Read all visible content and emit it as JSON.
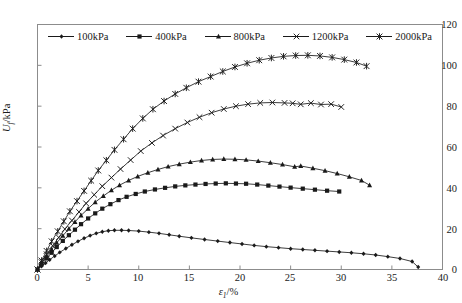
{
  "figure": {
    "background": "#ffffff",
    "frame_color": "#8c8c8c",
    "line_color": "#1a1a1a"
  },
  "axes": {
    "y": {
      "title": "U",
      "title_sub": "f",
      "title_unit": "/kPa",
      "min": 0,
      "max": 120,
      "ticks": [
        0,
        20,
        40,
        60,
        80,
        100,
        120
      ]
    },
    "x": {
      "title": "ε",
      "title_sub": "1",
      "title_unit": "/%",
      "min": 0,
      "max": 40,
      "ticks": [
        0,
        5,
        10,
        15,
        20,
        25,
        30,
        35,
        40
      ]
    }
  },
  "legend": {
    "position": "top-inside",
    "items": [
      {
        "label": "100kPa",
        "marker": "diamond-small"
      },
      {
        "label": "400kPa",
        "marker": "square"
      },
      {
        "label": "800kPa",
        "marker": "triangle"
      },
      {
        "label": "1200kPa",
        "marker": "x-cross"
      },
      {
        "label": "2000kPa",
        "marker": "asterisk"
      }
    ]
  },
  "chart_data": {
    "type": "line",
    "title": "",
    "xlabel": "ε₁/%",
    "ylabel": "U_f /kPa",
    "xlim": [
      0,
      40
    ],
    "ylim": [
      0,
      120
    ],
    "grid": false,
    "legend_position": "top-inside",
    "series": [
      {
        "name": "100kPa",
        "marker": "diamond-small",
        "x": [
          0,
          0.4,
          0.8,
          1.2,
          1.7,
          2.2,
          2.8,
          3.4,
          4.0,
          4.6,
          5.2,
          5.8,
          6.4,
          7.0,
          7.6,
          8.3,
          9.0,
          10.0,
          11.0,
          12.0,
          13.0,
          14.0,
          15.2,
          16.5,
          17.8,
          19.0,
          20.2,
          21.4,
          22.6,
          23.8,
          25.0,
          26.2,
          27.4,
          28.6,
          29.8,
          31.0,
          32.2,
          33.4,
          34.6,
          35.8,
          37.0,
          37.6
        ],
        "y": [
          0,
          1.6,
          3.2,
          4.8,
          6.6,
          8.4,
          10.3,
          12.1,
          13.8,
          15.3,
          16.6,
          17.7,
          18.5,
          19.0,
          19.2,
          19.2,
          19.1,
          18.8,
          18.3,
          17.7,
          17.0,
          16.3,
          15.5,
          14.7,
          13.9,
          13.2,
          12.5,
          11.8,
          11.2,
          10.7,
          10.2,
          9.8,
          9.4,
          9.0,
          8.6,
          8.2,
          7.7,
          7.1,
          6.3,
          5.4,
          3.9,
          1.2
        ]
      },
      {
        "name": "400kPa",
        "marker": "square",
        "x": [
          0,
          0.4,
          0.9,
          1.4,
          1.9,
          2.5,
          3.1,
          3.7,
          4.3,
          5.0,
          5.7,
          6.4,
          7.2,
          8.0,
          8.8,
          9.7,
          10.6,
          11.6,
          12.6,
          13.6,
          14.6,
          15.6,
          16.6,
          17.6,
          18.6,
          19.6,
          20.6,
          21.7,
          22.8,
          23.9,
          25.0,
          26.2,
          27.4,
          28.6,
          29.8
        ],
        "y": [
          0,
          2.6,
          5.4,
          8.2,
          11.0,
          14.0,
          16.8,
          19.5,
          22.2,
          25.0,
          27.5,
          29.8,
          32.0,
          34.0,
          35.6,
          37.0,
          38.2,
          39.2,
          40.0,
          40.7,
          41.2,
          41.6,
          41.9,
          42.1,
          42.2,
          42.1,
          42.0,
          41.6,
          41.1,
          40.6,
          40.1,
          39.6,
          39.1,
          38.6,
          38.2
        ]
      },
      {
        "name": "800kPa",
        "marker": "triangle",
        "x": [
          0,
          0.4,
          0.9,
          1.4,
          1.9,
          2.5,
          3.1,
          3.7,
          4.3,
          5.0,
          5.7,
          6.5,
          7.3,
          8.1,
          9.0,
          9.9,
          10.9,
          11.9,
          12.9,
          14.0,
          15.1,
          16.2,
          17.3,
          18.4,
          19.5,
          20.6,
          21.8,
          23.0,
          24.2,
          25.4,
          26.0,
          27.2,
          28.4,
          29.6,
          30.8,
          32.0,
          32.8
        ],
        "y": [
          0,
          3.1,
          6.4,
          9.8,
          13.1,
          16.5,
          20.0,
          23.3,
          26.5,
          29.8,
          33.0,
          36.0,
          38.8,
          41.3,
          43.6,
          45.6,
          47.4,
          49.0,
          50.4,
          51.6,
          52.6,
          53.4,
          53.9,
          54.1,
          54.0,
          53.7,
          53.1,
          52.3,
          51.4,
          50.3,
          50.7,
          49.6,
          48.4,
          47.0,
          45.4,
          43.6,
          41.3
        ]
      },
      {
        "name": "1200kPa",
        "marker": "x-cross",
        "x": [
          0,
          0.4,
          0.9,
          1.5,
          2.1,
          2.7,
          3.4,
          4.1,
          4.8,
          5.6,
          6.4,
          7.3,
          8.2,
          9.2,
          10.2,
          11.3,
          12.4,
          13.6,
          14.8,
          16.0,
          17.2,
          18.4,
          19.6,
          20.8,
          22.0,
          23.2,
          24.4
        ],
        "y": [
          0,
          3.6,
          7.5,
          11.6,
          15.7,
          19.8,
          24.0,
          28.2,
          32.4,
          36.6,
          40.8,
          45.0,
          49.2,
          53.6,
          58.0,
          62.0,
          65.6,
          69.0,
          72.0,
          74.6,
          76.8,
          78.6,
          80.0,
          81.0,
          81.6,
          81.8,
          81.6
        ]
      },
      {
        "name": "1200kPa-tail",
        "parent": "1200kPa",
        "marker": "x-cross",
        "x": [
          24.4,
          25.2,
          26.0,
          27.0,
          28.0,
          29.0,
          30.0
        ],
        "y": [
          81.6,
          81.4,
          80.9,
          81.5,
          80.8,
          81.0,
          79.6
        ]
      },
      {
        "name": "2000kPa",
        "marker": "asterisk",
        "x": [
          0,
          0.4,
          0.9,
          1.4,
          2.0,
          2.6,
          3.2,
          3.9,
          4.6,
          5.3,
          6.0,
          6.8,
          7.6,
          8.5,
          9.4,
          10.4,
          11.4,
          12.5,
          13.6,
          14.7,
          15.9,
          17.1,
          18.3,
          19.5,
          20.7,
          21.9,
          23.1,
          24.3,
          25.5,
          26.7,
          27.9,
          29.1,
          30.3,
          31.5,
          32.5
        ],
        "y": [
          0,
          4.4,
          9.1,
          13.8,
          18.7,
          23.6,
          28.5,
          33.5,
          38.5,
          43.5,
          48.5,
          53.5,
          58.6,
          63.8,
          69.0,
          74.0,
          78.5,
          82.5,
          86.0,
          89.0,
          92.0,
          94.5,
          97.0,
          99.2,
          101.0,
          102.5,
          103.6,
          104.4,
          104.8,
          104.9,
          104.6,
          103.9,
          102.8,
          101.4,
          99.6
        ]
      }
    ]
  }
}
